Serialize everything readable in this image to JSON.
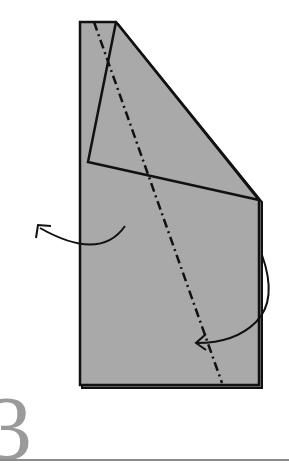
{
  "step": {
    "number": "3"
  },
  "colors": {
    "paper": "#a9a9a9",
    "line": "#111111",
    "step_number": "#9a9a9a",
    "rule": "#8a8a8a"
  },
  "diagram": {
    "paper_outline": "80,22 116,22 259,200 259,385 80,385",
    "flap": "116,22 88,162 259,200",
    "fold_line": {
      "type": "valley-dash-dot",
      "x1": 94,
      "y1": 22,
      "x2": 222,
      "y2": 383
    },
    "arrows": [
      {
        "name": "left-fold-arrow",
        "direction": "fold-behind-left"
      },
      {
        "name": "right-fold-arrow",
        "direction": "fold-over-diagonal"
      }
    ]
  }
}
